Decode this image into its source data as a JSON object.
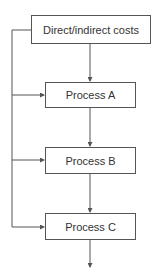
{
  "diagram": {
    "type": "flowchart",
    "nodes": [
      {
        "id": "costs",
        "label": "Direct/indirect costs"
      },
      {
        "id": "a",
        "label": "Process A"
      },
      {
        "id": "b",
        "label": "Process B"
      },
      {
        "id": "c",
        "label": "Process C"
      }
    ],
    "edges": [
      {
        "from": "costs",
        "to": "a"
      },
      {
        "from": "a",
        "to": "b"
      },
      {
        "from": "b",
        "to": "c"
      },
      {
        "from": "c",
        "to": "output"
      },
      {
        "from": "costs",
        "to": "a",
        "via": "left-bus"
      },
      {
        "from": "costs",
        "to": "b",
        "via": "left-bus"
      },
      {
        "from": "costs",
        "to": "c",
        "via": "left-bus"
      }
    ],
    "colors": {
      "line": "#555555",
      "text": "#333333",
      "background": "#ffffff"
    }
  }
}
